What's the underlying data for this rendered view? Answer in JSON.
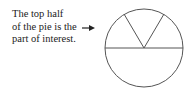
{
  "annotation": {
    "lines": [
      "The top half",
      "of the pie is the",
      "part of interest."
    ]
  },
  "diagram": {
    "type": "pie",
    "stroke_color": "#555555",
    "arrow_color": "#222222"
  }
}
